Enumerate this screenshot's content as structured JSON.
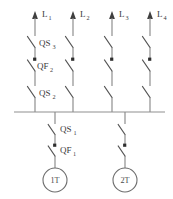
{
  "diagram": {
    "kind": "single-line-schematic",
    "colors": {
      "background": "#ffffff",
      "wire": "#8a8a8a",
      "blade": "#555555",
      "bus": "#909090",
      "label": "#3a3a3a",
      "breaker_mark": "#2e2e2e",
      "transformer": "#6e6e6e"
    },
    "busbar": {
      "name": "main-busbar",
      "y": 112,
      "x_start": 14,
      "x_end": 165
    },
    "feeders": [
      {
        "id": "feeder-1",
        "line_label": "L",
        "line_sub": "1",
        "x": 35,
        "arrow_tip_y": 12,
        "devices": [
          {
            "type": "disconnector",
            "label": "QS",
            "sub": "3",
            "label_visible": true,
            "y": 40
          },
          {
            "type": "breaker",
            "label": "QF",
            "sub": "2",
            "label_visible": true,
            "y": 63
          },
          {
            "type": "disconnector",
            "label": "QS",
            "sub": "2",
            "label_visible": true,
            "y": 90
          }
        ]
      },
      {
        "id": "feeder-2",
        "line_label": "L",
        "line_sub": "2",
        "x": 73,
        "arrow_tip_y": 12,
        "devices": [
          {
            "type": "disconnector",
            "label": "QS",
            "sub": "3",
            "label_visible": false,
            "y": 40
          },
          {
            "type": "breaker",
            "label": "QF",
            "sub": "2",
            "label_visible": false,
            "y": 63
          },
          {
            "type": "disconnector",
            "label": "QS",
            "sub": "2",
            "label_visible": false,
            "y": 90
          }
        ]
      },
      {
        "id": "feeder-3",
        "line_label": "L",
        "line_sub": "3",
        "x": 112,
        "arrow_tip_y": 12,
        "devices": [
          {
            "type": "disconnector",
            "label": "QS",
            "sub": "3",
            "label_visible": false,
            "y": 40
          },
          {
            "type": "breaker",
            "label": "QF",
            "sub": "2",
            "label_visible": false,
            "y": 63
          },
          {
            "type": "disconnector",
            "label": "QS",
            "sub": "2",
            "label_visible": false,
            "y": 90
          }
        ]
      },
      {
        "id": "feeder-4",
        "line_label": "L",
        "line_sub": "4",
        "x": 150,
        "arrow_tip_y": 12,
        "devices": [
          {
            "type": "disconnector",
            "label": "QS",
            "sub": "3",
            "label_visible": false,
            "y": 40
          },
          {
            "type": "breaker",
            "label": "QF",
            "sub": "2",
            "label_visible": false,
            "y": 63
          },
          {
            "type": "disconnector",
            "label": "QS",
            "sub": "2",
            "label_visible": false,
            "y": 90
          }
        ]
      }
    ],
    "incomers": [
      {
        "id": "incomer-1",
        "x": 55,
        "devices": [
          {
            "type": "disconnector",
            "label": "QS",
            "sub": "1",
            "label_visible": true,
            "y": 126
          },
          {
            "type": "breaker",
            "label": "QF",
            "sub": "1",
            "label_visible": true,
            "y": 147
          }
        ],
        "transformer": {
          "label": "1T",
          "cx": 55,
          "cy": 180,
          "r": 12
        }
      },
      {
        "id": "incomer-2",
        "x": 125,
        "devices": [
          {
            "type": "disconnector",
            "label": "QS",
            "sub": "1",
            "label_visible": false,
            "y": 126
          },
          {
            "type": "breaker",
            "label": "QF",
            "sub": "1",
            "label_visible": false,
            "y": 147
          }
        ],
        "transformer": {
          "label": "2T",
          "cx": 125,
          "cy": 180,
          "r": 12
        }
      }
    ],
    "labels": {
      "l1": "L",
      "l1_sub": "1",
      "l2": "L",
      "l2_sub": "2",
      "l3": "L",
      "l3_sub": "3",
      "l4": "L",
      "l4_sub": "4",
      "qs3": "QS",
      "qs3_sub": "3",
      "qf2": "QF",
      "qf2_sub": "2",
      "qs2": "QS",
      "qs2_sub": "2",
      "qs1": "QS",
      "qs1_sub": "1",
      "qf1": "QF",
      "qf1_sub": "1",
      "t1": "1T",
      "t2": "2T"
    }
  }
}
